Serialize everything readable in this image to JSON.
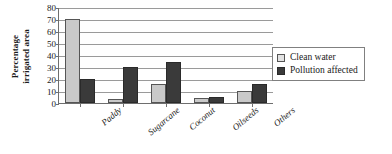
{
  "chart_data": {
    "type": "bar",
    "title": "",
    "xlabel": "",
    "ylabel": "Percentage irrigated area",
    "ylabel_line1": "Percentage",
    "ylabel_line2": "irrigated area",
    "ylim": [
      0,
      80
    ],
    "ytick_step": 10,
    "yticks": [
      80,
      70,
      60,
      50,
      40,
      30,
      20,
      10,
      0
    ],
    "grid": true,
    "legend_position": "right",
    "categories": [
      "Paddy",
      "Sugarcane",
      "Coconut",
      "Oilseeds",
      "Others"
    ],
    "series": [
      {
        "name": "Clean water",
        "color": "#c9c9c9",
        "values": [
          70,
          3,
          16,
          4,
          10
        ]
      },
      {
        "name": "Pollution affected",
        "color": "#3a3a3a",
        "values": [
          20,
          30,
          34,
          5,
          16
        ]
      }
    ]
  },
  "legend": {
    "entries": [
      {
        "label": "Clean water"
      },
      {
        "label": "Pollution affected"
      }
    ]
  },
  "colors": {
    "clean_water": "#c9c9c9",
    "pollution_affected": "#3a3a3a",
    "axis": "#6e6e6e",
    "gridline": "#9a9a9a",
    "background": "#ffffff"
  }
}
